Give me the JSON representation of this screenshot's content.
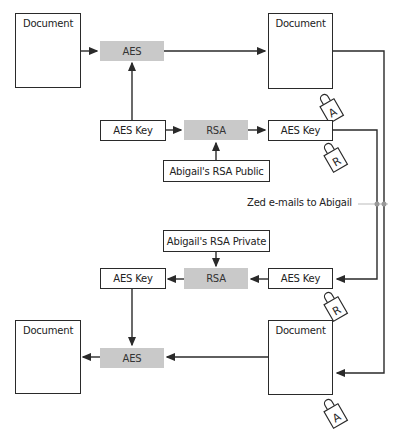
{
  "diagram": {
    "top": {
      "source_document": "Document",
      "encrypt_aes": "AES",
      "encrypted_document": "Document",
      "encrypted_document_lock": "A",
      "aes_key": "AES Key",
      "encrypt_rsa": "RSA",
      "encrypted_aes_key": "AES Key",
      "encrypted_aes_key_lock": "R",
      "rsa_public_key": "Abigail's RSA Public"
    },
    "transfer_label": "Zed e-mails to Abigail",
    "bottom": {
      "rsa_private_key": "Abigail's RSA Private",
      "decrypted_aes_key": "AES Key",
      "decrypt_rsa": "RSA",
      "received_aes_key": "AES Key",
      "received_aes_key_lock": "R",
      "decrypted_document": "Document",
      "decrypt_aes": "AES",
      "received_document": "Document",
      "received_document_lock": "A"
    },
    "colors": {
      "process_fill": "#c9c9c9",
      "line": "#2a2a2a",
      "connector": "#bbbbbb"
    }
  }
}
